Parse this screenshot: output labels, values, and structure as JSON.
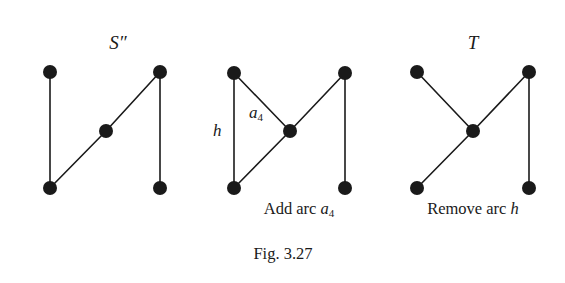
{
  "figure": {
    "caption": "Fig. 3.27",
    "background_color": "#ffffff",
    "ink_color": "#1a1a1a",
    "node_radius": 7,
    "edge_width": 1.6
  },
  "panels": [
    {
      "id": "panel-left",
      "title": "S″",
      "title_style": "italic",
      "caption": "",
      "nodes": [
        {
          "id": "tl",
          "x": 50,
          "y": 72
        },
        {
          "id": "bl",
          "x": 50,
          "y": 188
        },
        {
          "id": "c",
          "x": 106,
          "y": 131
        },
        {
          "id": "tr",
          "x": 160,
          "y": 72
        },
        {
          "id": "br",
          "x": 160,
          "y": 188
        }
      ],
      "edges": [
        {
          "from": "tl",
          "to": "bl",
          "label": ""
        },
        {
          "from": "bl",
          "to": "c",
          "label": ""
        },
        {
          "from": "c",
          "to": "tr",
          "label": ""
        },
        {
          "from": "tr",
          "to": "br",
          "label": ""
        }
      ],
      "edge_labels": []
    },
    {
      "id": "panel-middle",
      "title": "",
      "title_style": "italic",
      "caption_parts": {
        "prefix": "Add arc ",
        "symbol": "a",
        "sub": "4"
      },
      "nodes": [
        {
          "id": "tl",
          "x": 234,
          "y": 73
        },
        {
          "id": "bl",
          "x": 234,
          "y": 188
        },
        {
          "id": "c",
          "x": 290,
          "y": 131
        },
        {
          "id": "tr",
          "x": 345,
          "y": 73
        },
        {
          "id": "br",
          "x": 345,
          "y": 188
        }
      ],
      "edges": [
        {
          "from": "tl",
          "to": "bl",
          "label": "h"
        },
        {
          "from": "tl",
          "to": "c",
          "label": "a4"
        },
        {
          "from": "bl",
          "to": "c",
          "label": ""
        },
        {
          "from": "c",
          "to": "tr",
          "label": ""
        },
        {
          "from": "tr",
          "to": "br",
          "label": ""
        }
      ],
      "edge_labels": [
        {
          "id": "h",
          "text": "h",
          "sub": "",
          "x": 218,
          "y": 131
        },
        {
          "id": "a4",
          "text": "a",
          "sub": "4",
          "x": 254,
          "y": 113
        }
      ]
    },
    {
      "id": "panel-right",
      "title": "T",
      "title_style": "italic",
      "caption_parts": {
        "prefix": "Remove arc ",
        "symbol": "h",
        "sub": ""
      },
      "nodes": [
        {
          "id": "tl",
          "x": 417,
          "y": 72
        },
        {
          "id": "bl",
          "x": 417,
          "y": 188
        },
        {
          "id": "c",
          "x": 473,
          "y": 131
        },
        {
          "id": "tr",
          "x": 529,
          "y": 72
        },
        {
          "id": "br",
          "x": 529,
          "y": 188
        }
      ],
      "edges": [
        {
          "from": "tl",
          "to": "c",
          "label": ""
        },
        {
          "from": "bl",
          "to": "c",
          "label": ""
        },
        {
          "from": "c",
          "to": "tr",
          "label": ""
        },
        {
          "from": "tr",
          "to": "br",
          "label": ""
        }
      ],
      "edge_labels": []
    }
  ],
  "titles": {
    "left": {
      "text": "S″",
      "x": 118,
      "y": 45
    },
    "right": {
      "text": "T",
      "x": 473,
      "y": 45
    }
  },
  "captions": {
    "middle_prefix": "Add arc ",
    "middle_symbol": "a",
    "middle_sub": "4",
    "middle_x": 299,
    "middle_y": 211,
    "right_prefix": "Remove arc ",
    "right_symbol": "h",
    "right_x": 473,
    "right_y": 211,
    "figure_text": "Fig. 3.27",
    "figure_x": 283,
    "figure_y": 255
  }
}
